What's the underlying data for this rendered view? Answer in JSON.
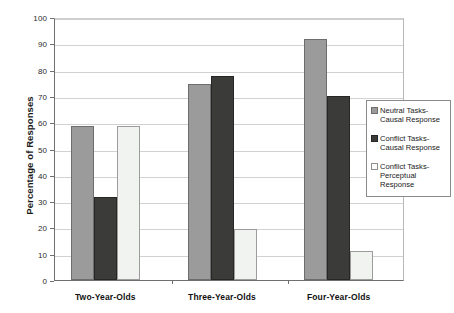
{
  "chart_data": {
    "type": "bar",
    "title": "",
    "xlabel": "",
    "ylabel": "Percentage of Responses",
    "ylim": [
      0,
      100
    ],
    "yticks": [
      0,
      10,
      20,
      30,
      40,
      50,
      60,
      70,
      80,
      90,
      100
    ],
    "grid": true,
    "legend_position": "right",
    "categories": [
      "Two-Year-Olds",
      "Three-Year-Olds",
      "Four-Year-Olds"
    ],
    "series": [
      {
        "name": "Neutral Tasks-Causal Response",
        "color": "#9b9b9b",
        "values": [
          58.5,
          74.5,
          91.5
        ]
      },
      {
        "name": "Conflict Tasks-Causal Response",
        "color": "#3b3b39",
        "values": [
          31.5,
          77.5,
          70.0
        ]
      },
      {
        "name": "Conflict Tasks-Perceptual Response",
        "color": "#f1f3f1",
        "values": [
          58.5,
          19.5,
          11.0
        ]
      }
    ]
  },
  "legend": {
    "items": [
      {
        "label": "Neutral Tasks-Causal Response",
        "swatch": "legend-swatch-neutral-causal"
      },
      {
        "label": "Conflict Tasks-Causal Response",
        "swatch": "legend-swatch-conflict-causal"
      },
      {
        "label": "Conflict Tasks-Perceptual Response",
        "swatch": "legend-swatch-conflict-perceptual"
      }
    ]
  },
  "axis": {
    "y_title": "Percentage of Responses",
    "y_tick_labels": [
      "0",
      "10",
      "20",
      "30",
      "40",
      "50",
      "60",
      "70",
      "80",
      "90",
      "100"
    ],
    "x_tick_labels": [
      "Two-Year-Olds",
      "Three-Year-Olds",
      "Four-Year-Olds"
    ]
  }
}
